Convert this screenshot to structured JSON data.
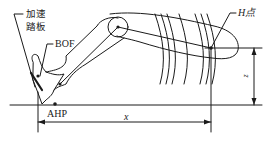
{
  "diagram": {
    "type": "driver-seating-geometry",
    "labels": {
      "pedal_line1": "加速",
      "pedal_line2": "踏板",
      "bof": "BOF",
      "ahp": "AHP",
      "h_point": "H点",
      "x_dim": "x",
      "z_dim": "z"
    },
    "colors": {
      "line": "#1a1a1a",
      "background": "#ffffff"
    }
  }
}
